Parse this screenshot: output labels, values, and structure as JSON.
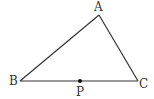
{
  "diagram": {
    "type": "triangle",
    "stroke_color": "#333333",
    "vertices": {
      "A": {
        "label": "A",
        "x": 99,
        "y": 15
      },
      "B": {
        "label": "B",
        "x": 20,
        "y": 81
      },
      "C": {
        "label": "C",
        "x": 138,
        "y": 81
      }
    },
    "points": {
      "P": {
        "label": "P",
        "x": 80,
        "y": 81,
        "on_segment": "BC"
      }
    },
    "segments": [
      "AB",
      "BC",
      "CA"
    ]
  }
}
